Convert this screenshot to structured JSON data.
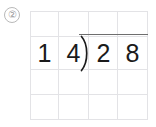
{
  "worksheet": {
    "problem_number_label": "②",
    "marker_name": "circled-number-two"
  },
  "grid": {
    "columns": 4,
    "rows": 4,
    "cell_width": 29,
    "cell_height": 27,
    "line_color": "#e3e3e6"
  },
  "division": {
    "divisor": "14",
    "dividend": "28",
    "divisor_digits": [
      "1",
      "4"
    ],
    "dividend_digits": [
      "2",
      "8"
    ],
    "bracket_symbol": ")",
    "has_overline": true,
    "ink_color": "#1b1b1b",
    "rule_color": "#6e6e6e"
  }
}
